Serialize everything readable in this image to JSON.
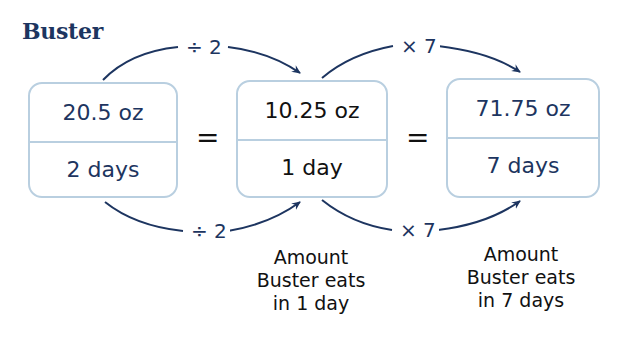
{
  "title": "Buster",
  "boxes": [
    {
      "numerator": "20.5 oz",
      "denominator": "2 days"
    },
    {
      "numerator": "10.25 oz",
      "denominator": "1 day"
    },
    {
      "numerator": "71.75 oz",
      "denominator": "7 days"
    }
  ],
  "equals": [
    "=",
    "="
  ],
  "operators": {
    "top_left": "÷ 2",
    "top_right": "× 7",
    "bottom_left": "÷ 2",
    "bottom_right": "× 7"
  },
  "captions": [
    {
      "lines": [
        "Amount",
        "Buster eats",
        "in 1 day"
      ]
    },
    {
      "lines": [
        "Amount",
        "Buster eats",
        "in 7 days"
      ]
    }
  ],
  "colors": {
    "navy": "#1d3560",
    "box_border": "#b9cfe0",
    "text_black": "#111111"
  }
}
